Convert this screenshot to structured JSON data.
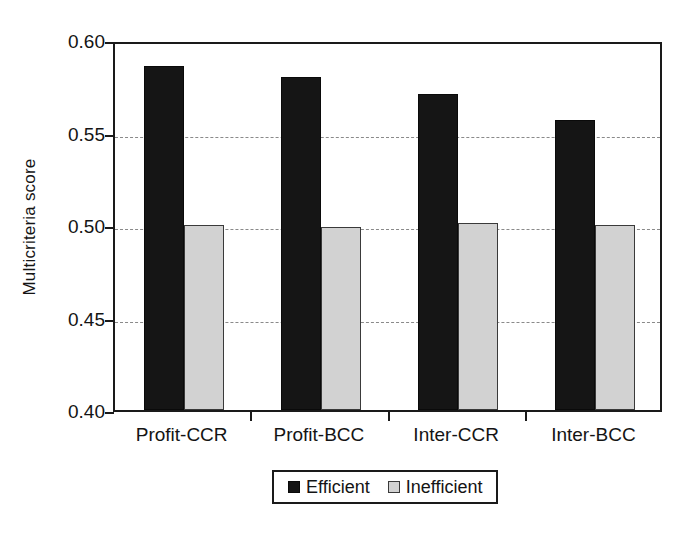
{
  "chart_data": {
    "type": "bar",
    "title": "",
    "xlabel": "",
    "ylabel": "Multicriteria score",
    "categories": [
      "Profit-CCR",
      "Profit-BCC",
      "Inter-CCR",
      "Inter-BCC"
    ],
    "series": [
      {
        "name": "Efficient",
        "color": "#151515",
        "values": [
          0.586,
          0.58,
          0.571,
          0.557
        ]
      },
      {
        "name": "Inefficient",
        "color": "#d2d2d2",
        "values": [
          0.5,
          0.499,
          0.501,
          0.5
        ]
      }
    ],
    "ylim": [
      0.4,
      0.6
    ],
    "yticks": [
      0.4,
      0.45,
      0.5,
      0.55,
      0.6
    ],
    "ytick_labels": [
      "0.40",
      "0.45",
      "0.50",
      "0.55",
      "0.60"
    ],
    "gridlines": {
      "y": [
        0.45,
        0.5,
        0.55
      ],
      "style": "dashed",
      "x": false
    },
    "legend_position": "bottom-center",
    "legend_entries": [
      "Efficient",
      "Inefficient"
    ]
  },
  "axes": {
    "y_title": "Multicriteria score"
  },
  "legend": {
    "items": [
      {
        "label": "Efficient",
        "swatch": "filled-black-square-icon"
      },
      {
        "label": "Inefficient",
        "swatch": "filled-gray-square-icon"
      }
    ]
  }
}
